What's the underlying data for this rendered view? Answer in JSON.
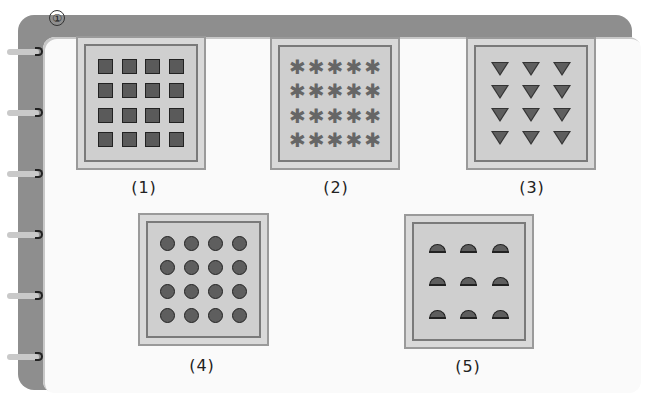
{
  "figure": {
    "question_number": "①",
    "panels": [
      {
        "id": 1,
        "label": "(1)",
        "shape": "square",
        "rows": 4,
        "cols": 4,
        "count": 16
      },
      {
        "id": 2,
        "label": "(2)",
        "shape": "asterisk",
        "rows": 4,
        "cols": 5,
        "count": 20
      },
      {
        "id": 3,
        "label": "(3)",
        "shape": "down-triangle",
        "rows": 4,
        "cols": 3,
        "count": 12
      },
      {
        "id": 4,
        "label": "(4)",
        "shape": "circle",
        "rows": 4,
        "cols": 4,
        "count": 16
      },
      {
        "id": 5,
        "label": "(5)",
        "shape": "semicircle",
        "rows": 3,
        "cols": 3,
        "count": 9
      }
    ]
  },
  "labels": {
    "p1": "(1)",
    "p2": "(2)",
    "p3": "(3)",
    "p4": "(4)",
    "p5": "(5)"
  },
  "colors": {
    "frame": "#8e8e8e",
    "page": "#fafafa",
    "panel_fill": "#cfcfcf",
    "shape_fill": "#5e5e5e"
  }
}
